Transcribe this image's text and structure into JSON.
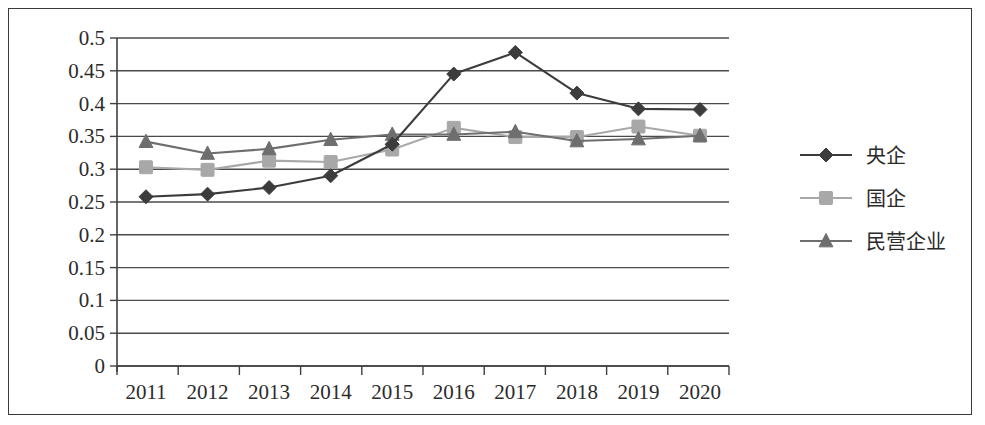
{
  "chart_data": {
    "type": "line",
    "title": "",
    "xlabel": "",
    "ylabel": "",
    "categories": [
      "2011",
      "2012",
      "2013",
      "2014",
      "2015",
      "2016",
      "2017",
      "2018",
      "2019",
      "2020"
    ],
    "ylim": [
      0,
      0.5
    ],
    "ytick_labels": [
      "0",
      "0.05",
      "0.1",
      "0.15",
      "0.2",
      "0.25",
      "0.3",
      "0.35",
      "0.4",
      "0.45",
      "0.5"
    ],
    "ytick_values": [
      0,
      0.05,
      0.1,
      0.15,
      0.2,
      0.25,
      0.3,
      0.35,
      0.4,
      0.45,
      0.5
    ],
    "grid": "horizontal",
    "legend_position": "right",
    "series": [
      {
        "name": "央企",
        "marker": "diamond",
        "color": "#3c3c3c",
        "values": [
          0.258,
          0.262,
          0.272,
          0.29,
          0.338,
          0.445,
          0.478,
          0.416,
          0.392,
          0.391
        ]
      },
      {
        "name": "国企",
        "marker": "square",
        "color": "#a8a8a8",
        "values": [
          0.303,
          0.299,
          0.313,
          0.311,
          0.33,
          0.363,
          0.349,
          0.349,
          0.365,
          0.351
        ]
      },
      {
        "name": "民营企业",
        "marker": "triangle",
        "color": "#6e6e6e",
        "values": [
          0.342,
          0.324,
          0.331,
          0.345,
          0.353,
          0.353,
          0.357,
          0.343,
          0.346,
          0.351
        ]
      }
    ]
  },
  "legend": {
    "items": [
      {
        "label": "央企"
      },
      {
        "label": "国企"
      },
      {
        "label": "民营企业"
      }
    ]
  }
}
